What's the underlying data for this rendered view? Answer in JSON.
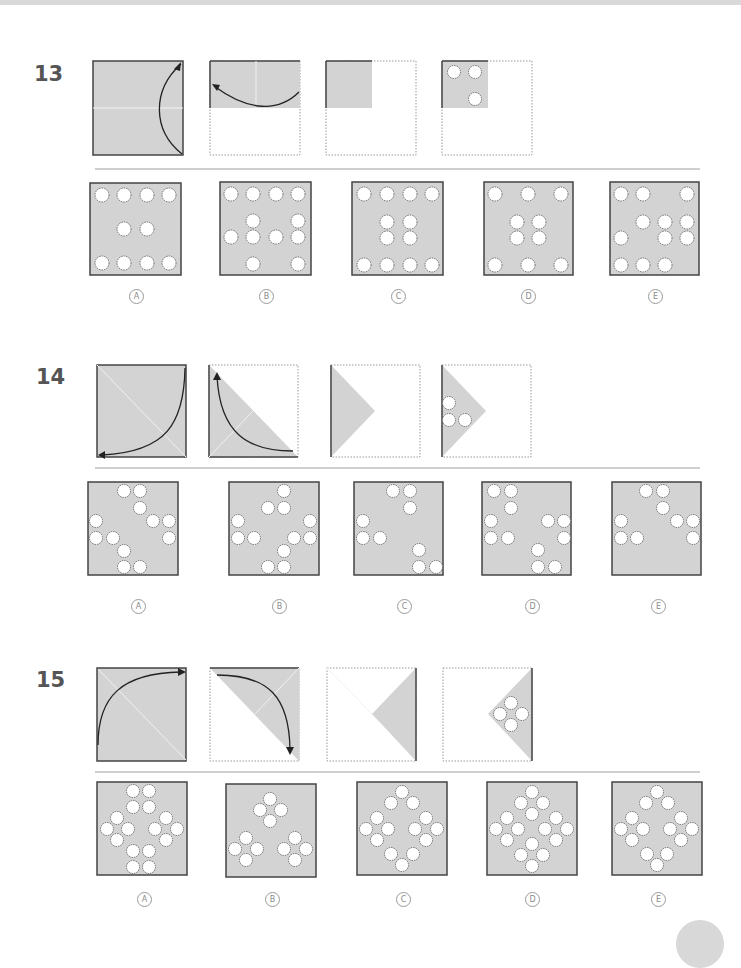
{
  "colors": {
    "paper": "#d3d3d3",
    "edge": "#444444",
    "hole_fill": "#ffffff",
    "hole_border": "#555555",
    "fold_line": "#f2f2f2",
    "arrow": "#222222",
    "divider": "#cfcfcf"
  },
  "questions": [
    {
      "number": "13",
      "steps": [
        "fold-bottom-up",
        "fold-right-to-left",
        "folded-quarter",
        "punched-quarter-3-holes"
      ],
      "options": [
        {
          "label": "A",
          "holes": 10
        },
        {
          "label": "B",
          "holes": 10
        },
        {
          "label": "C",
          "holes": 12
        },
        {
          "label": "D",
          "holes": 10
        },
        {
          "label": "E",
          "holes": 11
        }
      ]
    },
    {
      "number": "14",
      "steps": [
        "fold-diagonal-top-right-to-bottom-left",
        "fold-triangle-up",
        "folded-triangle",
        "punched-triangle-3-holes"
      ],
      "options": [
        {
          "label": "A",
          "holes": 12
        },
        {
          "label": "B",
          "holes": 12
        },
        {
          "label": "C",
          "holes": 9
        },
        {
          "label": "D",
          "holes": 12
        },
        {
          "label": "E",
          "holes": 9
        }
      ]
    },
    {
      "number": "15",
      "steps": [
        "fold-diagonal-bottom-left-to-top-right",
        "fold-triangle-down",
        "folded-triangle",
        "punched-triangle-4-holes"
      ],
      "options": [
        {
          "label": "A",
          "holes": 16
        },
        {
          "label": "B",
          "holes": 12
        },
        {
          "label": "C",
          "holes": 14
        },
        {
          "label": "D",
          "holes": 16
        },
        {
          "label": "E",
          "holes": 14
        }
      ]
    }
  ]
}
